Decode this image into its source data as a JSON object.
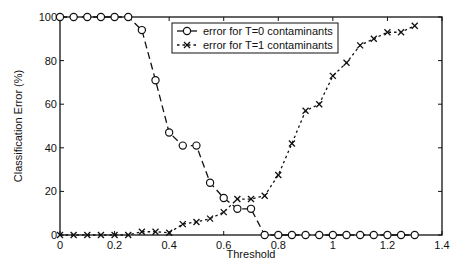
{
  "chart_data": {
    "type": "line",
    "title": "",
    "xlabel": "Threshold",
    "ylabel": "Classification Error (%)",
    "xlim": [
      0,
      1.4
    ],
    "ylim": [
      0,
      100
    ],
    "xticks": [
      0,
      0.2,
      0.4,
      0.6,
      0.8,
      1,
      1.2,
      1.4
    ],
    "xtick_labels": [
      "0",
      "0.2",
      "0.4",
      "0.6",
      "0.8",
      "1",
      "1.2",
      "1.4"
    ],
    "yticks": [
      0,
      20,
      40,
      60,
      80,
      100
    ],
    "ytick_labels": [
      "0",
      "20",
      "40",
      "60",
      "80",
      "100"
    ],
    "grid": false,
    "legend_position": "upper center",
    "x": [
      0,
      0.05,
      0.1,
      0.15,
      0.2,
      0.25,
      0.3,
      0.35,
      0.4,
      0.45,
      0.5,
      0.55,
      0.6,
      0.65,
      0.7,
      0.75,
      0.8,
      0.85,
      0.9,
      0.95,
      1.0,
      1.05,
      1.1,
      1.15,
      1.2,
      1.25,
      1.3
    ],
    "series": [
      {
        "name": "error for T=0 contaminants",
        "marker": "o",
        "linestyle": "dashed",
        "values": [
          100,
          100,
          100,
          100,
          100,
          100,
          94,
          71,
          47,
          41,
          41,
          24,
          17,
          12,
          12,
          0,
          0,
          0,
          0,
          0,
          0,
          0,
          0,
          0,
          0,
          0,
          0
        ]
      },
      {
        "name": "error for T=1 contaminants",
        "marker": "x",
        "linestyle": "dotted",
        "values": [
          0,
          0,
          0,
          0,
          0,
          0,
          1.5,
          1.5,
          1,
          5,
          6,
          7.5,
          10.5,
          16.5,
          16.5,
          18,
          27.5,
          42,
          57,
          60,
          73,
          79,
          87,
          90,
          93,
          93,
          96
        ]
      }
    ]
  },
  "legend": {
    "items": [
      {
        "label": "error for T=0 contaminants"
      },
      {
        "label": "error for T=1 contaminants"
      }
    ]
  },
  "axes": {
    "xlabel": "Threshold",
    "ylabel": "Classification Error (%)"
  },
  "colors": {
    "line": "#111111",
    "background": "#ffffff"
  }
}
